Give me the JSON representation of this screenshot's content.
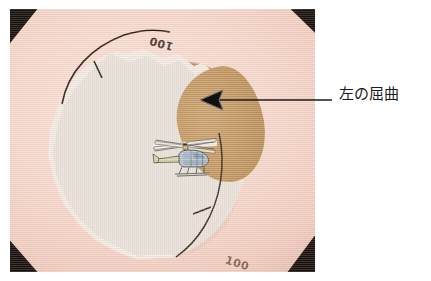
{
  "figure": {
    "kind": "annotated-endoscopic-photograph",
    "width": 431,
    "height": 281,
    "background_color": "#ffffff"
  },
  "photo": {
    "plate_border_color": "#120b08",
    "field_color": "#f7d9cd",
    "corner_vignette_color": "#140c08"
  },
  "specimen": {
    "mass_label": "orange lesion mass",
    "mass_color": "#d4532c",
    "mass_edge_color": "#f4ece4",
    "flexion_band_label": "tan flexion shoulder",
    "flexion_band_color": "#c79d67"
  },
  "scale": {
    "top_marking": "100",
    "bottom_marking": "100",
    "line_color": "#2a1d16"
  },
  "sticker": {
    "name": "helicopter-sticker",
    "body_color": "#b9c3cc",
    "rotor_color": "#e8e4d8",
    "trim_color": "#d8d6a8",
    "outline_color": "#2b2b2b"
  },
  "annotation": {
    "caption": "左の屈曲",
    "caption_color": "#1b1b1b",
    "leader_color": "#1b1b1b",
    "arrow_name": "left-pointing-arrow",
    "arrow_tip_x": 200,
    "arrow_tip_y": 100,
    "leader_end_x": 425,
    "leader_y": 100
  }
}
